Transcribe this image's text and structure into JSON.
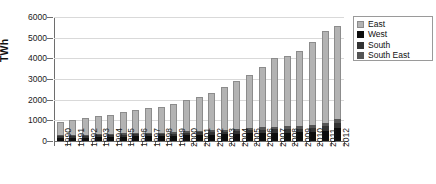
{
  "chart_data": {
    "type": "bar",
    "stacked": true,
    "title": "",
    "subtitle": "",
    "xlabel": "",
    "ylabel": "TWh",
    "ylim": [
      0,
      6000
    ],
    "ytick_step": 1000,
    "yticks": [
      0,
      1000,
      2000,
      3000,
      4000,
      5000,
      6000
    ],
    "ytick_labels": [
      "0",
      "1000",
      "2000",
      "3000",
      "4000",
      "5000",
      "6000"
    ],
    "grid": true,
    "grid_axis": "y",
    "legend_position": "right-top",
    "categories": [
      "1990",
      "1991",
      "1992",
      "1993",
      "1994",
      "1995",
      "1996",
      "1997",
      "1998",
      "1999",
      "2000",
      "2001",
      "2002",
      "2003",
      "2004",
      "2005",
      "2006",
      "2007",
      "2008",
      "2009",
      "2010",
      "2011",
      "2012"
    ],
    "series": [
      {
        "name": "West",
        "color": "#0d0d0d",
        "values": [
          160,
          165,
          170,
          200,
          205,
          215,
          225,
          235,
          240,
          250,
          280,
          300,
          310,
          320,
          330,
          370,
          390,
          410,
          410,
          420,
          450,
          500,
          620
        ]
      },
      {
        "name": "South",
        "color": "#333333",
        "values": [
          75,
          75,
          80,
          85,
          90,
          90,
          95,
          100,
          100,
          105,
          115,
          120,
          125,
          130,
          135,
          145,
          155,
          165,
          170,
          175,
          190,
          210,
          250
        ]
      },
      {
        "name": "South East",
        "color": "#555555",
        "values": [
          45,
          45,
          50,
          55,
          55,
          60,
          60,
          65,
          65,
          70,
          80,
          85,
          90,
          95,
          100,
          110,
          115,
          125,
          130,
          135,
          145,
          165,
          180
        ]
      },
      {
        "name": "East",
        "color": "#b3b3b3",
        "values": [
          620,
          715,
          800,
          860,
          920,
          1035,
          1140,
          1200,
          1235,
          1375,
          1525,
          1625,
          1815,
          2090,
          2325,
          2565,
          2900,
          3320,
          3410,
          3640,
          4005,
          4455,
          4500
        ]
      }
    ],
    "totals": [
      900,
      1000,
      1100,
      1200,
      1270,
      1400,
      1520,
      1600,
      1640,
      1800,
      2000,
      2130,
      2340,
      2635,
      2890,
      3190,
      3560,
      4020,
      4120,
      4370,
      4790,
      5330,
      5550
    ]
  },
  "legend": {
    "items": [
      {
        "label": "East",
        "swatch": "east"
      },
      {
        "label": "West",
        "swatch": "west"
      },
      {
        "label": "South",
        "swatch": "south"
      },
      {
        "label": "South East",
        "swatch": "southeast"
      }
    ]
  },
  "axis": {
    "y_title": "TWh"
  }
}
